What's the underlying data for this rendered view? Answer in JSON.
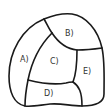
{
  "diagram": {
    "type": "partitioned-shape",
    "regions": [
      {
        "id": "A",
        "label": "A)",
        "x": 20,
        "y": 62
      },
      {
        "id": "B",
        "label": "B)",
        "x": 65,
        "y": 36
      },
      {
        "id": "C",
        "label": "C)",
        "x": 50,
        "y": 64
      },
      {
        "id": "D",
        "label": "D)",
        "x": 44,
        "y": 96
      },
      {
        "id": "E",
        "label": "E)",
        "x": 83,
        "y": 74
      }
    ],
    "colors": {
      "stroke": "#1a1a1a",
      "label": "#333333",
      "background": "#ffffff"
    }
  }
}
